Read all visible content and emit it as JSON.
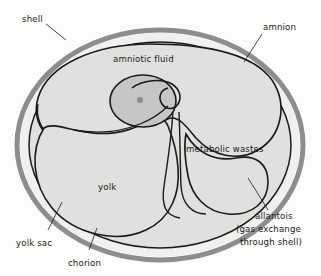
{
  "diagram": {
    "background_color": "#fdfdfb",
    "colors": {
      "shell": "#8f8f8f",
      "albumen": "#efefef",
      "membrane_fill": "#dcdcdc",
      "embryo_fill": "#c8c8c8",
      "outline": "#1a1a1a",
      "text": "#1a1a1a"
    },
    "labels": {
      "shell": "shell",
      "amnion": "amnion",
      "amniotic_fluid": "amniotic fluid",
      "metabolic_wastes": "metabolic wastes",
      "allantois": "allantois",
      "allantois_note_line1": "(gas exchange",
      "allantois_note_line2": "through shell)",
      "yolk": "yolk",
      "yolk_sac": "yolk sac",
      "chorion": "chorion"
    }
  }
}
